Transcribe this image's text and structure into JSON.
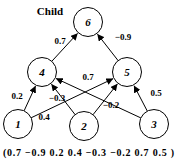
{
  "title": "Child",
  "weight_vector": "(0.7 −0.9 0.2 0.4 −0.3 −0.2 0.7 0.5 )",
  "colors": {
    "ink": "#000000",
    "background": "#ffffff"
  },
  "network": {
    "node_radius": 14.5,
    "nodes": [
      {
        "id": "1",
        "x": 18,
        "y": 124
      },
      {
        "id": "2",
        "x": 84,
        "y": 126
      },
      {
        "id": "3",
        "x": 154,
        "y": 124
      },
      {
        "id": "4",
        "x": 42,
        "y": 72
      },
      {
        "id": "5",
        "x": 127,
        "y": 72
      },
      {
        "id": "6",
        "x": 88,
        "y": 22
      }
    ],
    "edges": [
      {
        "from": "1",
        "to": "4",
        "weight": "0.2",
        "label_x": 17,
        "label_y": 99
      },
      {
        "from": "2",
        "to": "4",
        "weight": "−0.3",
        "label_x": 57,
        "label_y": 101
      },
      {
        "from": "3",
        "to": "4",
        "weight": "0.7",
        "label_x": 88,
        "label_y": 80
      },
      {
        "from": "1",
        "to": "5",
        "weight": "0.4",
        "label_x": 44,
        "label_y": 120
      },
      {
        "from": "2",
        "to": "5",
        "weight": "−0.2",
        "label_x": 111,
        "label_y": 108
      },
      {
        "from": "3",
        "to": "5",
        "weight": "0.5",
        "label_x": 156,
        "label_y": 96
      },
      {
        "from": "4",
        "to": "6",
        "weight": "0.7",
        "label_x": 60,
        "label_y": 44
      },
      {
        "from": "5",
        "to": "6",
        "weight": "−0.9",
        "label_x": 123,
        "label_y": 40
      }
    ]
  }
}
